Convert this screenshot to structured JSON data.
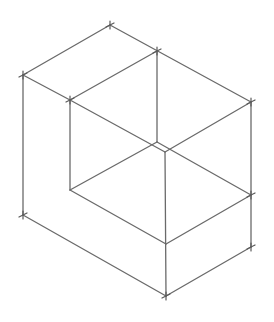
{
  "diagram": {
    "type": "isometric-sketch",
    "line_color": "#6a6a6a",
    "background": "#ffffff",
    "vertices": {
      "top": [
        110,
        25
      ],
      "left_top": [
        23,
        75
      ],
      "left_bottom": [
        23,
        215
      ],
      "inner_left_top": [
        70,
        100
      ],
      "inner_left_bottom": [
        70,
        190
      ],
      "inner_back_top": [
        157,
        51
      ],
      "inner_back_bottom": [
        157,
        142
      ],
      "inner_front_top": [
        165,
        152
      ],
      "right_top": [
        251,
        102
      ],
      "right_mid": [
        251,
        195
      ],
      "right_bottom": [
        251,
        247
      ],
      "front_mid": [
        166,
        244
      ],
      "bottom": [
        166,
        296
      ]
    },
    "edges": [
      [
        "top",
        "left_top"
      ],
      [
        "top",
        "right_top"
      ],
      [
        "left_top",
        "inner_left_top"
      ],
      [
        "inner_left_top",
        "inner_back_top"
      ],
      [
        "left_top",
        "left_bottom"
      ],
      [
        "inner_left_top",
        "inner_left_bottom"
      ],
      [
        "inner_back_top",
        "inner_back_bottom"
      ],
      [
        "inner_left_top",
        "inner_front_top"
      ],
      [
        "inner_front_top",
        "right_top"
      ],
      [
        "inner_front_top",
        "bottom"
      ],
      [
        "right_top",
        "right_bottom"
      ],
      [
        "inner_left_bottom",
        "inner_back_bottom"
      ],
      [
        "inner_back_bottom",
        "right_mid"
      ],
      [
        "inner_left_bottom",
        "front_mid"
      ],
      [
        "front_mid",
        "right_mid"
      ],
      [
        "left_bottom",
        "bottom"
      ],
      [
        "bottom",
        "right_bottom"
      ]
    ],
    "tick_marks": [
      "top",
      "left_top",
      "inner_left_top",
      "inner_back_top",
      "right_top",
      "left_bottom",
      "right_bottom",
      "bottom",
      "right_mid"
    ]
  }
}
